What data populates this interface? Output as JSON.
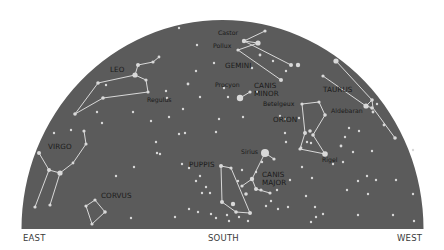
{
  "colors": {
    "sky": "#5b5b5b",
    "star": "#d9d9d9",
    "line": "#e6e6e6",
    "label": "#1a1a1a",
    "background": "#ffffff"
  },
  "dome": {
    "cx": 222.5,
    "cy": 229,
    "rx": 201,
    "ry": 209
  },
  "directions": {
    "east": "EAST",
    "south": "SOUTH",
    "west": "WEST"
  },
  "constellation_labels": [
    {
      "id": "leo",
      "text": "LEO",
      "x": 110,
      "y": 72
    },
    {
      "id": "gemini",
      "text": "GEMINI",
      "x": 225,
      "y": 68
    },
    {
      "id": "canis-minor-1",
      "text": "CANIS",
      "x": 254,
      "y": 88
    },
    {
      "id": "canis-minor-2",
      "text": "MINOR",
      "x": 254,
      "y": 96
    },
    {
      "id": "taurus",
      "text": "TAURUS",
      "x": 323,
      "y": 92
    },
    {
      "id": "orion",
      "text": "ORION",
      "x": 273,
      "y": 122
    },
    {
      "id": "virgo",
      "text": "VIRGO",
      "x": 48,
      "y": 149
    },
    {
      "id": "puppis",
      "text": "PUPPIS",
      "x": 189,
      "y": 167
    },
    {
      "id": "canis-major-1",
      "text": "CANIS",
      "x": 262,
      "y": 177
    },
    {
      "id": "canis-major-2",
      "text": "MAJOR",
      "x": 262,
      "y": 185
    },
    {
      "id": "corvus",
      "text": "CORVUS",
      "x": 101,
      "y": 198
    }
  ],
  "star_labels": [
    {
      "id": "castor",
      "text": "Castor",
      "x": 218,
      "y": 35
    },
    {
      "id": "pollux",
      "text": "Pollux",
      "x": 213,
      "y": 48
    },
    {
      "id": "regulus",
      "text": "Regulus",
      "x": 147,
      "y": 102
    },
    {
      "id": "procyon",
      "text": "Procyon",
      "x": 215,
      "y": 87
    },
    {
      "id": "betelgeux",
      "text": "Betelgeux",
      "x": 263,
      "y": 106
    },
    {
      "id": "aldebaran",
      "text": "Aldebaran",
      "x": 331,
      "y": 113
    },
    {
      "id": "rigel",
      "text": "Rigel",
      "x": 322,
      "y": 162
    },
    {
      "id": "sirius",
      "text": "Sirius",
      "x": 241,
      "y": 154
    }
  ],
  "constellations": [
    {
      "name": "leo",
      "lines": [
        [
          [
            153,
            62
          ],
          [
            159,
            57
          ]
        ],
        [
          [
            138,
            65
          ],
          [
            153,
            62
          ]
        ],
        [
          [
            135,
            75
          ],
          [
            138,
            65
          ]
        ],
        [
          [
            135,
            75
          ],
          [
            146,
            80
          ]
        ],
        [
          [
            146,
            80
          ],
          [
            148,
            92
          ]
        ],
        [
          [
            148,
            92
          ],
          [
            103,
            98
          ]
        ],
        [
          [
            98,
            83
          ],
          [
            135,
            75
          ]
        ],
        [
          [
            98,
            83
          ],
          [
            75,
            114
          ]
        ],
        [
          [
            75,
            114
          ],
          [
            103,
            98
          ]
        ]
      ]
    },
    {
      "name": "gemini",
      "lines": [
        [
          [
            244,
            41
          ],
          [
            265,
            31
          ]
        ],
        [
          [
            238,
            50
          ],
          [
            258,
            43
          ]
        ],
        [
          [
            244,
            41
          ],
          [
            291,
            65
          ]
        ],
        [
          [
            238,
            50
          ],
          [
            281,
            80
          ]
        ],
        [
          [
            258,
            43
          ],
          [
            244,
            41
          ]
        ]
      ]
    },
    {
      "name": "canis-minor",
      "lines": [
        [
          [
            240,
            98
          ],
          [
            250,
            92
          ]
        ]
      ]
    },
    {
      "name": "taurus",
      "lines": [
        [
          [
            336,
            61
          ],
          [
            372,
            100
          ]
        ],
        [
          [
            323,
            76
          ],
          [
            366,
            106
          ]
        ],
        [
          [
            366,
            106
          ],
          [
            372,
            100
          ]
        ],
        [
          [
            372,
            100
          ],
          [
            373,
            108
          ]
        ],
        [
          [
            373,
            108
          ],
          [
            395,
            138
          ]
        ],
        [
          [
            366,
            106
          ],
          [
            373,
            108
          ]
        ]
      ]
    },
    {
      "name": "orion",
      "lines": [
        [
          [
            302,
            104
          ],
          [
            319,
            102
          ]
        ],
        [
          [
            319,
            102
          ],
          [
            325,
            115
          ]
        ],
        [
          [
            325,
            115
          ],
          [
            313,
            135
          ]
        ],
        [
          [
            302,
            104
          ],
          [
            305,
            133
          ]
        ],
        [
          [
            305,
            133
          ],
          [
            300,
            149
          ]
        ],
        [
          [
            300,
            149
          ],
          [
            325,
            154
          ]
        ],
        [
          [
            313,
            135
          ],
          [
            325,
            154
          ]
        ]
      ]
    },
    {
      "name": "virgo",
      "lines": [
        [
          [
            39,
            153
          ],
          [
            49,
            170
          ]
        ],
        [
          [
            49,
            170
          ],
          [
            60,
            173
          ]
        ],
        [
          [
            60,
            173
          ],
          [
            73,
            163
          ]
        ],
        [
          [
            73,
            163
          ],
          [
            86,
            144
          ]
        ],
        [
          [
            86,
            144
          ],
          [
            84,
            131
          ]
        ],
        [
          [
            49,
            170
          ],
          [
            35,
            207
          ]
        ],
        [
          [
            60,
            173
          ],
          [
            50,
            205
          ]
        ]
      ]
    },
    {
      "name": "corvus",
      "lines": [
        [
          [
            86,
            206
          ],
          [
            95,
            200
          ]
        ],
        [
          [
            95,
            200
          ],
          [
            105,
            212
          ]
        ],
        [
          [
            105,
            212
          ],
          [
            92,
            224
          ]
        ],
        [
          [
            92,
            224
          ],
          [
            86,
            206
          ]
        ]
      ]
    },
    {
      "name": "canis-major",
      "lines": [
        [
          [
            265,
            153
          ],
          [
            252,
            179
          ]
        ],
        [
          [
            252,
            179
          ],
          [
            242,
            186
          ]
        ],
        [
          [
            252,
            179
          ],
          [
            256,
            189
          ]
        ],
        [
          [
            256,
            189
          ],
          [
            270,
            193
          ]
        ],
        [
          [
            265,
            153
          ],
          [
            274,
            159
          ]
        ]
      ]
    },
    {
      "name": "puppis",
      "lines": [
        [
          [
            221,
            166
          ],
          [
            222,
            202
          ]
        ],
        [
          [
            221,
            166
          ],
          [
            231,
            168
          ]
        ],
        [
          [
            231,
            168
          ],
          [
            250,
            213
          ]
        ],
        [
          [
            222,
            202
          ],
          [
            236,
            212
          ]
        ],
        [
          [
            236,
            212
          ],
          [
            250,
            213
          ]
        ]
      ]
    }
  ],
  "stars": [
    [
      179,
      28,
      1.2
    ],
    [
      265,
      31,
      1.6
    ],
    [
      258,
      43,
      2.6
    ],
    [
      244,
      41,
      2.2
    ],
    [
      238,
      50,
      1.6
    ],
    [
      291,
      65,
      2.0
    ],
    [
      298,
      65,
      2.2
    ],
    [
      281,
      80,
      2.0
    ],
    [
      286,
      71,
      1.2
    ],
    [
      273,
      61,
      1.2
    ],
    [
      260,
      55,
      1.4
    ],
    [
      252,
      68,
      1.2
    ],
    [
      214,
      63,
      1.2
    ],
    [
      153,
      62,
      1.6
    ],
    [
      159,
      57,
      1.4
    ],
    [
      138,
      65,
      2.0
    ],
    [
      135,
      75,
      2.6
    ],
    [
      146,
      80,
      1.6
    ],
    [
      148,
      92,
      1.6
    ],
    [
      103,
      98,
      1.8
    ],
    [
      98,
      83,
      1.8
    ],
    [
      75,
      114,
      1.8
    ],
    [
      106,
      85,
      1.2
    ],
    [
      166,
      91,
      1.2
    ],
    [
      197,
      45,
      1.2
    ],
    [
      196,
      71,
      1.2
    ],
    [
      188,
      84,
      1.4
    ],
    [
      167,
      98,
      1.2
    ],
    [
      200,
      97,
      1.2
    ],
    [
      183,
      109,
      1.2
    ],
    [
      169,
      117,
      1.2
    ],
    [
      151,
      121,
      1.2
    ],
    [
      133,
      112,
      1.2
    ],
    [
      97,
      112,
      1.2
    ],
    [
      102,
      123,
      1.2
    ],
    [
      54,
      133,
      1.2
    ],
    [
      240,
      98,
      3.2
    ],
    [
      250,
      92,
      1.6
    ],
    [
      224,
      88,
      1.2
    ],
    [
      228,
      97,
      1.2
    ],
    [
      257,
      92,
      1.2
    ],
    [
      185,
      133,
      1.2
    ],
    [
      219,
      119,
      1.2
    ],
    [
      243,
      117,
      1.2
    ],
    [
      216,
      132,
      1.2
    ],
    [
      160,
      154,
      1.2
    ],
    [
      156,
      142,
      1.2
    ],
    [
      336,
      61,
      2.6
    ],
    [
      323,
      76,
      1.6
    ],
    [
      366,
      106,
      2.6
    ],
    [
      372,
      100,
      1.8
    ],
    [
      372,
      108,
      1.8
    ],
    [
      377,
      104,
      1.2
    ],
    [
      373,
      112,
      1.4
    ],
    [
      384,
      125,
      1.4
    ],
    [
      395,
      138,
      1.8
    ],
    [
      302,
      104,
      1.6
    ],
    [
      319,
      102,
      1.6
    ],
    [
      325,
      115,
      1.8
    ],
    [
      305,
      133,
      2.0
    ],
    [
      310,
      131,
      1.8
    ],
    [
      313,
      135,
      1.8
    ],
    [
      307,
      142,
      1.2
    ],
    [
      300,
      149,
      1.6
    ],
    [
      325,
      154,
      2.8
    ],
    [
      349,
      128,
      1.2
    ],
    [
      345,
      137,
      1.2
    ],
    [
      341,
      146,
      1.4
    ],
    [
      353,
      152,
      1.2
    ],
    [
      343,
      162,
      1.2
    ],
    [
      333,
      164,
      1.2
    ],
    [
      311,
      143,
      1.2
    ],
    [
      280,
      116,
      1.2
    ],
    [
      285,
      119,
      1.2
    ],
    [
      285,
      133,
      1.2
    ],
    [
      299,
      118,
      1.2
    ],
    [
      39,
      153,
      2.0
    ],
    [
      49,
      170,
      2.0
    ],
    [
      60,
      173,
      2.6
    ],
    [
      73,
      163,
      1.4
    ],
    [
      86,
      144,
      1.6
    ],
    [
      84,
      131,
      1.6
    ],
    [
      71,
      130,
      1.2
    ],
    [
      35,
      207,
      1.6
    ],
    [
      50,
      205,
      1.6
    ],
    [
      116,
      176,
      1.2
    ],
    [
      134,
      167,
      1.2
    ],
    [
      157,
      153,
      1.2
    ],
    [
      179,
      134,
      1.2
    ],
    [
      86,
      206,
      1.6
    ],
    [
      95,
      200,
      1.6
    ],
    [
      105,
      212,
      1.8
    ],
    [
      92,
      224,
      1.6
    ],
    [
      131,
      218,
      1.2
    ],
    [
      265,
      153,
      4.0
    ],
    [
      274,
      159,
      1.6
    ],
    [
      252,
      179,
      2.2
    ],
    [
      242,
      186,
      1.6
    ],
    [
      256,
      189,
      2.0
    ],
    [
      261,
      190,
      1.6
    ],
    [
      270,
      193,
      1.6
    ],
    [
      262,
      162,
      1.2
    ],
    [
      242,
      170,
      1.2
    ],
    [
      256,
      172,
      1.2
    ],
    [
      238,
      181,
      1.2
    ],
    [
      286,
      142,
      1.2
    ],
    [
      301,
      148,
      1.4
    ],
    [
      302,
      167,
      1.2
    ],
    [
      312,
      178,
      1.2
    ],
    [
      290,
      180,
      1.2
    ],
    [
      277,
      190,
      1.2
    ],
    [
      271,
      201,
      1.2
    ],
    [
      266,
      206,
      1.2
    ],
    [
      221,
      166,
      2.0
    ],
    [
      231,
      168,
      1.6
    ],
    [
      222,
      202,
      2.0
    ],
    [
      236,
      212,
      1.8
    ],
    [
      250,
      213,
      2.0
    ],
    [
      233,
      204,
      2.2
    ],
    [
      246,
      194,
      1.8
    ],
    [
      200,
      176,
      1.2
    ],
    [
      206,
      187,
      1.2
    ],
    [
      210,
      193,
      1.2
    ],
    [
      182,
      164,
      1.2
    ],
    [
      189,
      168,
      1.2
    ],
    [
      196,
      181,
      1.2
    ],
    [
      202,
      193,
      1.2
    ],
    [
      175,
      217,
      1.2
    ],
    [
      189,
      209,
      1.2
    ],
    [
      198,
      212,
      1.2
    ],
    [
      211,
      214,
      1.2
    ],
    [
      216,
      218,
      1.2
    ],
    [
      227,
      215,
      1.2
    ],
    [
      229,
      221,
      1.2
    ],
    [
      239,
      217,
      1.2
    ],
    [
      248,
      221,
      1.2
    ],
    [
      278,
      209,
      1.2
    ],
    [
      288,
      207,
      1.2
    ],
    [
      316,
      217,
      1.2
    ],
    [
      306,
      196,
      1.2
    ],
    [
      315,
      207,
      1.2
    ],
    [
      359,
      131,
      1.2
    ],
    [
      372,
      151,
      1.2
    ],
    [
      367,
      176,
      1.2
    ],
    [
      368,
      194,
      1.2
    ],
    [
      358,
      181,
      1.2
    ],
    [
      376,
      180,
      1.2
    ],
    [
      396,
      180,
      1.2
    ],
    [
      413,
      150,
      1.2
    ],
    [
      413,
      194,
      1.2
    ],
    [
      393,
      215,
      1.2
    ],
    [
      414,
      221,
      1.2
    ],
    [
      358,
      215,
      1.2
    ],
    [
      347,
      190,
      1.2
    ],
    [
      323,
      214,
      1.2
    ],
    [
      311,
      222,
      1.2
    ]
  ]
}
